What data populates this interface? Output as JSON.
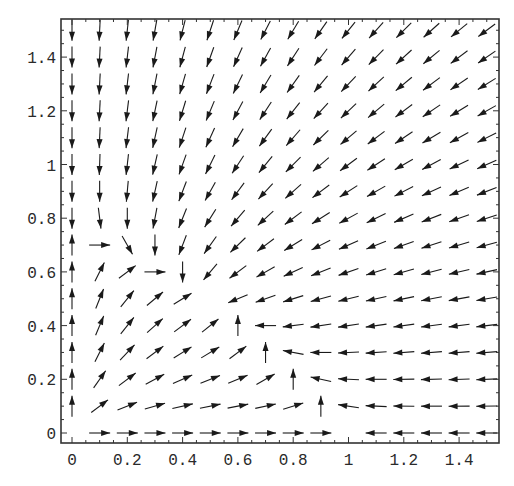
{
  "chart_data": {
    "type": "vector_field",
    "title": "",
    "xlabel": "",
    "ylabel": "",
    "model": {
      "dx": "x*(1 - x - y)",
      "dy": "y*(0.75 - y - 0.5*x)",
      "equilibria": [
        [
          0,
          0
        ],
        [
          1,
          0
        ],
        [
          0,
          0.75
        ],
        [
          0.5,
          0.5
        ]
      ]
    },
    "grid": {
      "x_start": 0,
      "x_end": 1.5,
      "y_start": 0,
      "y_end": 1.5,
      "step": 0.1
    },
    "xlim": [
      -0.03,
      1.53
    ],
    "ylim": [
      -0.03,
      1.56
    ],
    "xticks": [
      0,
      0.2,
      0.4,
      0.6,
      0.8,
      1,
      1.2,
      1.4
    ],
    "xtick_labels": [
      "0",
      "0.2",
      "0.4",
      "0.6",
      "0.8",
      "1",
      "1.2",
      "1.4"
    ],
    "yticks": [
      0,
      0.2,
      0.4,
      0.6,
      0.8,
      1,
      1.2,
      1.4
    ],
    "ytick_labels": [
      "0",
      "0.2",
      "0.4",
      "0.6",
      "0.8",
      "1",
      "1.2",
      "1.4"
    ],
    "grid_lines": false,
    "legend": null,
    "arrow_length_px": 21,
    "colors": {
      "arrow": "#1a1a1a",
      "frame": "#333333",
      "background": "#ffffff"
    }
  }
}
